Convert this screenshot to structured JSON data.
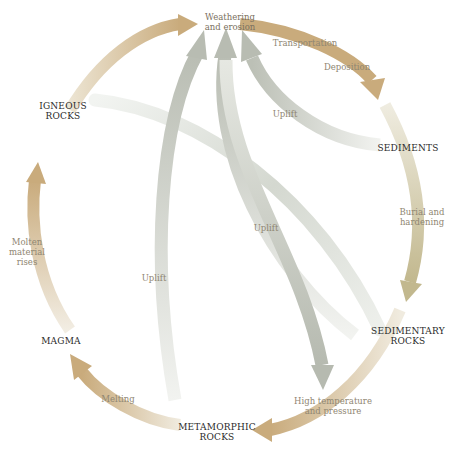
{
  "colors": {
    "cycle_arrow": "#c9ab7c",
    "cycle_arrow_light": "#ece4d2",
    "sediment_arrow": "#c2b88e",
    "uplift_arrow": "#bcc0b6",
    "uplift_arrow_light": "#e3e6e0",
    "stage_text": "#2a2a2a",
    "process_text": "#8f8672"
  },
  "stages": {
    "weathering": {
      "line1": "Weathering",
      "line2": "and erosion"
    },
    "igneous": {
      "line1": "IGNEOUS",
      "line2": "ROCKS"
    },
    "sediments": {
      "line1": "SEDIMENTS"
    },
    "sedimentary": {
      "line1": "SEDIMENTARY",
      "line2": "ROCKS"
    },
    "metamorphic": {
      "line1": "METAMORPHIC",
      "line2": "ROCKS"
    },
    "magma": {
      "line1": "MAGMA"
    }
  },
  "processes": {
    "transportation": "Transportation",
    "deposition": "Deposition",
    "uplift_top": "Uplift",
    "burial": {
      "line1": "Burial and",
      "line2": "hardening"
    },
    "uplift_middle": "Uplift",
    "uplift_left": "Uplift",
    "high_temp": {
      "line1": "High temperature",
      "line2": "and pressure"
    },
    "melting": "Melting",
    "molten": {
      "line1": "Molten",
      "line2": "material",
      "line3": "rises"
    }
  }
}
